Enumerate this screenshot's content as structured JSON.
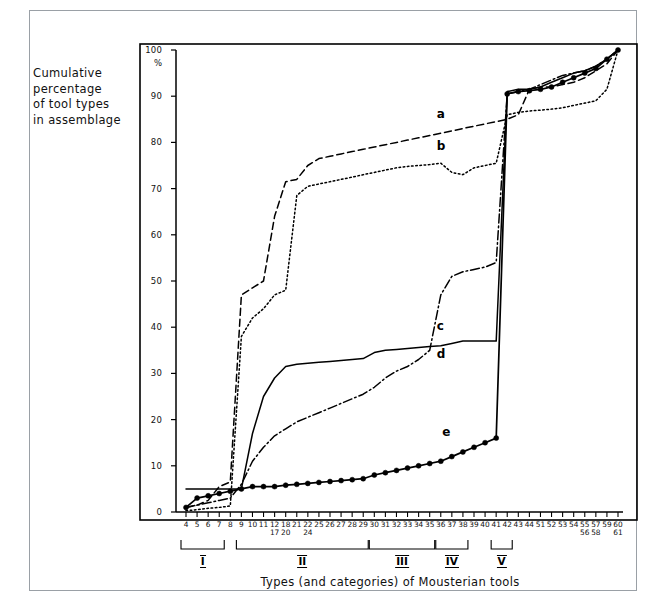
{
  "figure": {
    "y_axis_caption": [
      "Cumulative",
      "percentage",
      "of tool types",
      "in assemblage"
    ],
    "x_axis_title": "Types (and categories) of Mousterian tools",
    "percent_symbol": "%"
  },
  "chart_data": {
    "type": "line",
    "title": "",
    "xlabel": "Types (and categories) of Mousterian tools",
    "ylabel": "Cumulative percentage of tool types in assemblage",
    "ylim": [
      0,
      100
    ],
    "yticks": [
      0,
      10,
      20,
      30,
      40,
      50,
      60,
      70,
      80,
      90,
      100
    ],
    "ytick_labels": [
      "0",
      "10",
      "20",
      "30",
      "40",
      "50",
      "60",
      "70",
      "80",
      "90",
      "100"
    ],
    "grid": false,
    "legend": "inline-labels",
    "x_tick_labels": [
      {
        "main": "4",
        "sub": ""
      },
      {
        "main": "5",
        "sub": ""
      },
      {
        "main": "6",
        "sub": ""
      },
      {
        "main": "7",
        "sub": ""
      },
      {
        "main": "8",
        "sub": ""
      },
      {
        "main": "9",
        "sub": ""
      },
      {
        "main": "10",
        "sub": ""
      },
      {
        "main": "11",
        "sub": ""
      },
      {
        "main": "12",
        "sub": "17"
      },
      {
        "main": "18",
        "sub": "20"
      },
      {
        "main": "21",
        "sub": ""
      },
      {
        "main": "22",
        "sub": "24"
      },
      {
        "main": "25",
        "sub": ""
      },
      {
        "main": "26",
        "sub": ""
      },
      {
        "main": "27",
        "sub": ""
      },
      {
        "main": "28",
        "sub": ""
      },
      {
        "main": "29",
        "sub": ""
      },
      {
        "main": "30",
        "sub": ""
      },
      {
        "main": "31",
        "sub": ""
      },
      {
        "main": "32",
        "sub": ""
      },
      {
        "main": "33",
        "sub": ""
      },
      {
        "main": "34",
        "sub": ""
      },
      {
        "main": "35",
        "sub": ""
      },
      {
        "main": "36",
        "sub": ""
      },
      {
        "main": "37",
        "sub": ""
      },
      {
        "main": "38",
        "sub": ""
      },
      {
        "main": "39",
        "sub": ""
      },
      {
        "main": "40",
        "sub": ""
      },
      {
        "main": "41",
        "sub": ""
      },
      {
        "main": "42",
        "sub": ""
      },
      {
        "main": "43",
        "sub": ""
      },
      {
        "main": "44",
        "sub": ""
      },
      {
        "main": "51",
        "sub": ""
      },
      {
        "main": "52",
        "sub": ""
      },
      {
        "main": "53",
        "sub": ""
      },
      {
        "main": "54",
        "sub": ""
      },
      {
        "main": "55",
        "sub": "56"
      },
      {
        "main": "57",
        "sub": "58"
      },
      {
        "main": "59",
        "sub": ""
      },
      {
        "main": "60",
        "sub": "61"
      }
    ],
    "category_brackets": [
      {
        "label": "I",
        "start_index": 0,
        "end_index": 3
      },
      {
        "label": "II",
        "start_index": 5,
        "end_index": 16
      },
      {
        "label": "III",
        "start_index": 17,
        "end_index": 22
      },
      {
        "label": "IV",
        "start_index": 23,
        "end_index": 25
      },
      {
        "label": "V",
        "start_index": 28,
        "end_index": 29
      }
    ],
    "series": [
      {
        "name": "a",
        "style": "dashed",
        "color": "#000000",
        "marker": "none",
        "label_index": 23.0,
        "label_value": 83,
        "values": [
          1.0,
          1.5,
          2.5,
          5.5,
          6.5,
          47.0,
          48.5,
          50.0,
          64.0,
          71.5,
          72.0,
          75.0,
          76.5,
          77.0,
          77.5,
          78.0,
          78.5,
          79.0,
          79.5,
          80.0,
          80.5,
          81.0,
          81.5,
          82.0,
          82.5,
          83.0,
          83.5,
          84.0,
          84.5,
          85.0,
          86.0,
          91.5,
          92.0,
          92.0,
          92.5,
          93.0,
          94.0,
          95.5,
          97.0,
          100.0
        ]
      },
      {
        "name": "b",
        "style": "dotted",
        "color": "#000000",
        "marker": "none",
        "label_index": 23.0,
        "label_value": 76,
        "values": [
          0.3,
          0.5,
          0.8,
          1.0,
          1.3,
          38.0,
          42.0,
          44.0,
          47.0,
          48.0,
          68.5,
          70.5,
          71.0,
          71.5,
          72.0,
          72.5,
          73.0,
          73.5,
          74.0,
          74.5,
          74.8,
          75.0,
          75.2,
          75.5,
          73.5,
          73.0,
          74.5,
          75.0,
          75.5,
          86.0,
          86.5,
          86.8,
          87.0,
          87.2,
          87.5,
          88.0,
          88.5,
          89.0,
          91.5,
          100.0
        ]
      },
      {
        "name": "c",
        "style": "solid",
        "color": "#000000",
        "marker": "none",
        "label_index": 23.0,
        "label_value": 37,
        "values": [
          5.0,
          5.0,
          5.0,
          5.0,
          5.0,
          5.0,
          17.0,
          25.0,
          29.0,
          31.5,
          32.0,
          32.2,
          32.4,
          32.6,
          32.8,
          33.0,
          33.2,
          34.5,
          35.0,
          35.2,
          35.4,
          35.6,
          35.8,
          36.0,
          36.5,
          37.0,
          37.0,
          37.0,
          37.0,
          91.0,
          91.5,
          91.5,
          92.0,
          93.0,
          94.0,
          95.0,
          95.5,
          96.5,
          98.0,
          100.0
        ]
      },
      {
        "name": "d",
        "style": "dashdot",
        "color": "#000000",
        "marker": "none",
        "label_index": 23.0,
        "label_value": 31,
        "values": [
          1.0,
          1.5,
          2.0,
          2.5,
          3.0,
          6.0,
          11.0,
          14.0,
          16.5,
          18.0,
          19.5,
          20.5,
          21.5,
          22.5,
          23.5,
          24.5,
          25.5,
          27.0,
          29.0,
          30.5,
          31.5,
          33.0,
          35.0,
          47.0,
          51.0,
          52.0,
          52.5,
          53.0,
          54.0,
          90.5,
          91.0,
          91.5,
          92.5,
          93.5,
          94.5,
          95.0,
          95.5,
          96.5,
          98.0,
          100.0
        ]
      },
      {
        "name": "e",
        "style": "solid-markers",
        "color": "#000000",
        "marker": "filled-circle",
        "label_index": 23.5,
        "label_value": 14,
        "values": [
          1.0,
          3.0,
          3.5,
          4.0,
          4.5,
          5.0,
          5.5,
          5.5,
          5.5,
          5.8,
          6.0,
          6.2,
          6.4,
          6.6,
          6.8,
          7.0,
          7.2,
          8.0,
          8.5,
          9.0,
          9.5,
          10.0,
          10.5,
          11.0,
          12.0,
          13.0,
          14.0,
          15.0,
          16.0,
          90.5,
          91.0,
          91.2,
          91.5,
          92.0,
          93.0,
          94.0,
          95.0,
          96.0,
          98.0,
          100.0
        ]
      }
    ]
  }
}
